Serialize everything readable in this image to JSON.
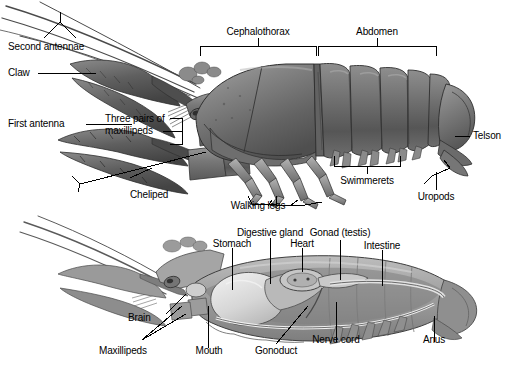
{
  "figure": {
    "background_color": "#ffffff",
    "ink_color": "#000000",
    "panels": [
      {
        "id": "external",
        "caption": "External anatomy (dorsolateral view)"
      },
      {
        "id": "internal",
        "caption": "Internal anatomy (sagittal section)"
      }
    ]
  },
  "external_labels": {
    "second_antennae": "Second antennae",
    "claw": "Claw",
    "first_antenna": "First antenna",
    "three_pairs_of_maxillipeds_line1": "Three pairs of",
    "three_pairs_of_maxillipeds_line2": "maxillipeds",
    "cephalothorax": "Cephalothorax",
    "abdomen": "Abdomen",
    "telson": "Telson",
    "swimmerets": "Swimmerets",
    "uropods": "Uropods",
    "cheliped": "Cheliped",
    "walking_legs": "Walking legs"
  },
  "internal_labels": {
    "stomach": "Stomach",
    "digestive_gland": "Digestive gland",
    "heart": "Heart",
    "gonad_testis": "Gonad (testis)",
    "intestine": "Intestine",
    "brain": "Brain",
    "maxillipeds": "Maxillipeds",
    "mouth": "Mouth",
    "gonoduct": "Gonoduct",
    "nerve_cord": "Nerve cord",
    "anus": "Anus"
  }
}
